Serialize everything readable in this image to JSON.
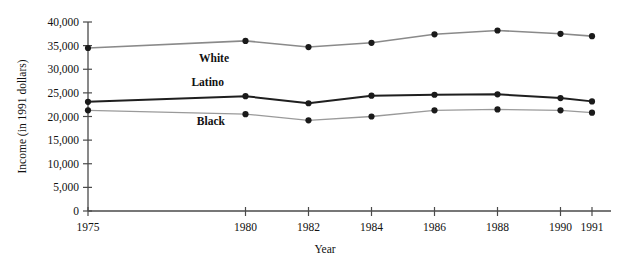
{
  "chart_data": {
    "type": "line",
    "title": "",
    "xlabel": "Year",
    "ylabel": "Income (in 1991 dollars)",
    "x": [
      1975,
      1980,
      1982,
      1984,
      1986,
      1988,
      1990,
      1991
    ],
    "xtick_labels": [
      "1975",
      "1980",
      "1982",
      "1984",
      "1986",
      "1988",
      "1990",
      "1991"
    ],
    "ytick_labels": [
      "0",
      "5,000",
      "10,000",
      "15,000",
      "20,000",
      "25,000",
      "30,000",
      "35,000",
      "40,000"
    ],
    "ytick_values": [
      0,
      5000,
      10000,
      15000,
      20000,
      25000,
      30000,
      35000,
      40000
    ],
    "ylim": [
      0,
      40000
    ],
    "xlim": [
      1975,
      1991
    ],
    "grid": false,
    "legend_position": "inline-labels",
    "series": [
      {
        "name": "White",
        "color": "#8a8a8a",
        "marker_color": "#1a1a1a",
        "line_width": 1.6,
        "label_x": 1979.0,
        "label_y": 31600,
        "values": [
          34500,
          36000,
          34700,
          35600,
          37400,
          38200,
          37500,
          37000
        ]
      },
      {
        "name": "Latino",
        "color": "#1f1f1f",
        "marker_color": "#1a1a1a",
        "line_width": 2.0,
        "label_x": 1978.8,
        "label_y": 26400,
        "values": [
          23100,
          24300,
          22800,
          24400,
          24600,
          24700,
          23900,
          23200
        ]
      },
      {
        "name": "Black",
        "color": "#9a9a9a",
        "marker_color": "#1a1a1a",
        "line_width": 1.3,
        "label_x": 1978.9,
        "label_y": 18100,
        "values": [
          21300,
          20500,
          19200,
          20000,
          21300,
          21500,
          21300,
          20800
        ]
      }
    ]
  }
}
